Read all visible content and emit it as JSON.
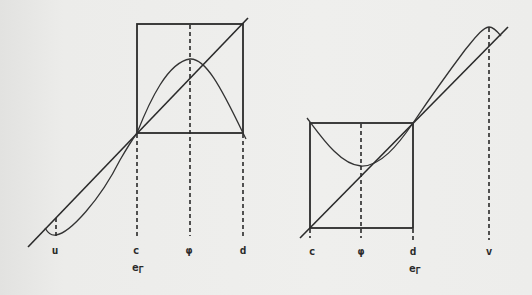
{
  "figure": {
    "background_color": "#ececea",
    "ink_color": "#2a2a2a"
  },
  "left_diagram": {
    "labels": {
      "u": "u",
      "c": "c",
      "phi": "φ",
      "d": "d",
      "e_main": "e",
      "e_sub": "Γ"
    },
    "box": {
      "x1": 137,
      "y1": 24,
      "x2": 243,
      "y2": 133
    },
    "diagonal": {
      "x1": 28,
      "y1": 247,
      "x2": 248,
      "y2": 18
    },
    "curve_description": "unimodal map with maximum at φ, fixed point at c, local minimum near u"
  },
  "right_diagram": {
    "labels": {
      "c": "c",
      "phi": "φ",
      "d": "d",
      "v": "v",
      "e_main": "e",
      "e_sub": "Γ"
    },
    "box": {
      "x1": 310,
      "y1": 123,
      "x2": 413,
      "y2": 228
    },
    "diagonal": {
      "x1": 300,
      "y1": 238,
      "x2": 508,
      "y2": 27
    },
    "curve_description": "map with minimum at φ inside box, fixed point at d, local maximum near v"
  }
}
